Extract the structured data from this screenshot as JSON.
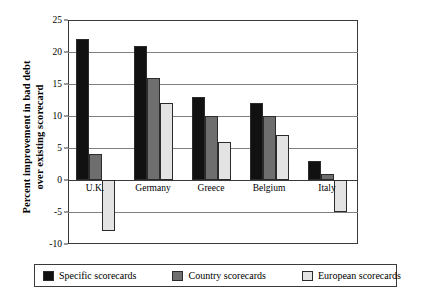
{
  "chart_data": {
    "type": "bar",
    "title": "",
    "xlabel": "",
    "ylabel_line1": "Percent improvement in bad debt",
    "ylabel_line2": "over existing scorecard",
    "categories": [
      "U.K.",
      "Germany",
      "Greece",
      "Belgium",
      "Italy"
    ],
    "series": [
      {
        "name": "Specific scorecards",
        "color": "#111111",
        "values": [
          22,
          21,
          13,
          12,
          3
        ]
      },
      {
        "name": "Country scorecards",
        "color": "#6e6e6e",
        "values": [
          4,
          16,
          10,
          10,
          1
        ]
      },
      {
        "name": "European scorecards",
        "color": "#e3e3e3",
        "values": [
          -8,
          12,
          6,
          7,
          -5
        ]
      }
    ],
    "ylim": [
      -10,
      25
    ],
    "yticks": [
      25,
      20,
      15,
      10,
      5,
      0,
      -5,
      -10
    ],
    "ytick_labels": [
      "25",
      "20",
      "15",
      "10",
      "5",
      "0",
      "-5",
      "-10"
    ],
    "grid": true,
    "legend_position": "bottom"
  }
}
